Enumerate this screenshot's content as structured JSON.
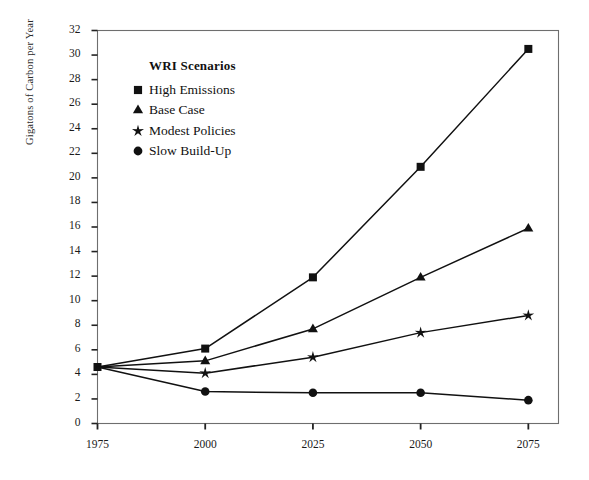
{
  "chart_data": {
    "type": "line",
    "title": "",
    "xlabel": "",
    "ylabel": "Gigatons of Carbon per Year",
    "x": [
      1975,
      2000,
      2025,
      2050,
      2075
    ],
    "xticklabels": [
      "1975",
      "2000",
      "2025",
      "2050",
      "2075"
    ],
    "xlim": [
      1975,
      2082
    ],
    "ylim": [
      0,
      32
    ],
    "yticks": [
      0,
      2,
      4,
      6,
      8,
      10,
      12,
      14,
      16,
      18,
      20,
      22,
      24,
      26,
      28,
      30,
      32
    ],
    "yticklabels": [
      "0",
      "2",
      "4",
      "6",
      "8",
      "10",
      "12",
      "14",
      "16",
      "18",
      "20",
      "22",
      "24",
      "26",
      "28",
      "30",
      "32"
    ],
    "grid": false,
    "legend_position": "upper-left-inside",
    "legend_title": "WRI Scenarios",
    "series": [
      {
        "name": "High Emissions",
        "marker": "square",
        "values": [
          4.6,
          6.1,
          11.9,
          20.9,
          30.5
        ]
      },
      {
        "name": "Base Case",
        "marker": "triangle",
        "values": [
          4.6,
          5.1,
          7.7,
          11.9,
          15.9
        ]
      },
      {
        "name": "Modest Policies",
        "marker": "star",
        "values": [
          4.6,
          4.1,
          5.4,
          7.4,
          8.8
        ]
      },
      {
        "name": "Slow Build-Up",
        "marker": "circle",
        "values": [
          4.6,
          2.6,
          2.5,
          2.5,
          1.9
        ]
      }
    ],
    "line_color": "#111111",
    "marker_color": "#111111",
    "axis_color": "#555555"
  }
}
